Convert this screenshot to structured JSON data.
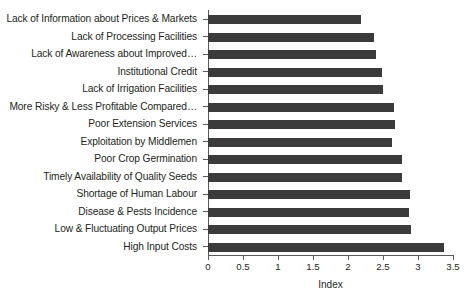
{
  "chart_data": {
    "type": "bar",
    "orientation": "horizontal",
    "title": "",
    "xlabel": "Index",
    "ylabel": "",
    "xlim": [
      0,
      3.5
    ],
    "xticks": [
      "0",
      "0.5",
      "1",
      "1.5",
      "2",
      "2.5",
      "3",
      "3.5"
    ],
    "xtick_values": [
      0,
      0.5,
      1,
      1.5,
      2,
      2.5,
      3,
      3.5
    ],
    "grid": false,
    "legend": false,
    "bar_color": "#3b3b3b",
    "axis_color": "#58595b",
    "categories": [
      "Lack of Information about Prices & Markets",
      "Lack of Processing Facilities",
      "Lack of Awareness about Improved…",
      "Institutional Credit",
      "Lack of Irrigation Facilities",
      "More Risky & Less Profitable Compared…",
      "Poor Extension Services",
      "Exploitation by Middlemen",
      "Poor Crop Germination",
      "Timely Availability of Quality Seeds",
      "Shortage of Human Labour",
      "Disease & Pests Incidence",
      "Low & Fluctuating Output Prices",
      "High Input Costs"
    ],
    "values": [
      2.19,
      2.37,
      2.4,
      2.49,
      2.5,
      2.66,
      2.67,
      2.63,
      2.77,
      2.77,
      2.89,
      2.87,
      2.9,
      3.37
    ]
  }
}
